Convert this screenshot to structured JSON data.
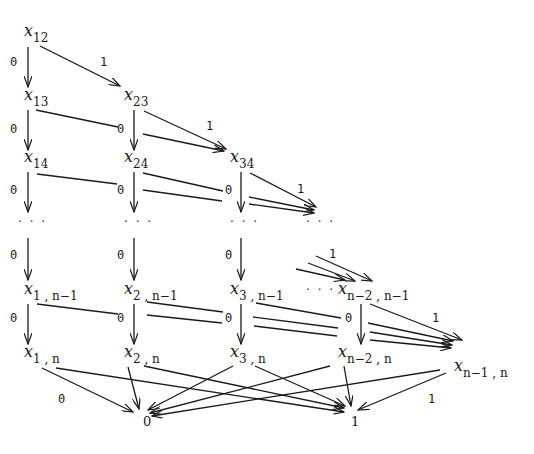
{
  "diagram": {
    "colors": {
      "ink": "#1a1a1a",
      "background": "#ffffff"
    },
    "nodes": [
      {
        "id": "x12",
        "var": "x",
        "sub": "12",
        "x": 24,
        "y": 36
      },
      {
        "id": "x13",
        "var": "x",
        "sub": "13",
        "x": 24,
        "y": 100
      },
      {
        "id": "x23",
        "var": "x",
        "sub": "23",
        "x": 124,
        "y": 100
      },
      {
        "id": "x14",
        "var": "x",
        "sub": "14",
        "x": 24,
        "y": 162
      },
      {
        "id": "x24",
        "var": "x",
        "sub": "24",
        "x": 124,
        "y": 162
      },
      {
        "id": "x34",
        "var": "x",
        "sub": "34",
        "x": 230,
        "y": 162
      },
      {
        "id": "x1n1",
        "var": "x",
        "sub": "1 , n−1",
        "x": 24,
        "y": 294
      },
      {
        "id": "x2n1",
        "var": "x",
        "sub": "2 , n−1",
        "x": 124,
        "y": 294
      },
      {
        "id": "x3n1",
        "var": "x",
        "sub": "3 , n−1",
        "x": 230,
        "y": 294
      },
      {
        "id": "xn2n1",
        "var": "x",
        "sub": "n−2 , n−1",
        "x": 338,
        "y": 294
      },
      {
        "id": "x1n",
        "var": "x",
        "sub": "1 , n",
        "x": 24,
        "y": 357
      },
      {
        "id": "x2n",
        "var": "x",
        "sub": "2 , n",
        "x": 124,
        "y": 357
      },
      {
        "id": "x3n",
        "var": "x",
        "sub": "3 , n",
        "x": 230,
        "y": 357
      },
      {
        "id": "xn2n",
        "var": "x",
        "sub": "n−2 , n",
        "x": 338,
        "y": 357
      },
      {
        "id": "xn1n",
        "var": "x",
        "sub": "n−1 , n",
        "x": 454,
        "y": 371
      }
    ],
    "terminals": [
      {
        "id": "zero",
        "label": "0",
        "x": 143,
        "y": 426
      },
      {
        "id": "one",
        "label": "1",
        "x": 351,
        "y": 426
      }
    ],
    "ellipses": [
      {
        "label": "· · ·",
        "x": 18,
        "y": 226
      },
      {
        "label": "· · ·",
        "x": 124,
        "y": 226
      },
      {
        "label": "· · ·",
        "x": 230,
        "y": 226
      },
      {
        "label": "· · ·",
        "x": 306,
        "y": 226
      },
      {
        "label": "· · ·",
        "x": 306,
        "y": 294
      }
    ],
    "edge_labels": [
      {
        "label": "0",
        "x": 10,
        "y": 66
      },
      {
        "label": "1",
        "x": 100,
        "y": 66
      },
      {
        "label": "0",
        "x": 10,
        "y": 133
      },
      {
        "label": "0",
        "x": 117,
        "y": 133
      },
      {
        "label": "1",
        "x": 206,
        "y": 130
      },
      {
        "label": "0",
        "x": 10,
        "y": 194
      },
      {
        "label": "0",
        "x": 117,
        "y": 194
      },
      {
        "label": "0",
        "x": 225,
        "y": 194
      },
      {
        "label": "1",
        "x": 297,
        "y": 193
      },
      {
        "label": "0",
        "x": 10,
        "y": 259
      },
      {
        "label": "0",
        "x": 117,
        "y": 259
      },
      {
        "label": "0",
        "x": 225,
        "y": 259
      },
      {
        "label": "1",
        "x": 329,
        "y": 258
      },
      {
        "label": "0",
        "x": 10,
        "y": 322
      },
      {
        "label": "0",
        "x": 117,
        "y": 322
      },
      {
        "label": "0",
        "x": 225,
        "y": 322
      },
      {
        "label": "0",
        "x": 345,
        "y": 322
      },
      {
        "label": "1",
        "x": 432,
        "y": 322
      },
      {
        "label": "0",
        "x": 58,
        "y": 403
      },
      {
        "label": "1",
        "x": 428,
        "y": 403
      }
    ]
  }
}
